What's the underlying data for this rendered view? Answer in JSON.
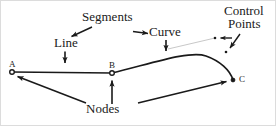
{
  "figure": {
    "kind": "bezier-path-annotation-diagram",
    "background_color": "#ffffff",
    "stroke_color": "#1a1a1a",
    "guide_color": "#c8c8c8",
    "border_color": "#d9d9d9"
  },
  "labels": {
    "segments": "Segments",
    "line": "Line",
    "curve": "Curve",
    "control_line1": "Control",
    "control_line2": "Points",
    "nodes": "Nodes"
  },
  "nodes": [
    {
      "id": "A",
      "label": "A",
      "x": 12,
      "y": 72
    },
    {
      "id": "B",
      "label": "B",
      "x": 112,
      "y": 73
    },
    {
      "id": "C",
      "label": "C",
      "x": 233,
      "y": 80
    }
  ],
  "control_points": [
    {
      "id": "cp1",
      "x": 215,
      "y": 38
    },
    {
      "id": "cp2",
      "x": 226,
      "y": 52
    }
  ],
  "path": {
    "line_segment": "M 12 72 L 112 73",
    "curve_segment": "M 112 73 C 150 64 190 50 206 56 C 220 61 230 70 233 80",
    "tangent_guide": "M 168 49 L 215 38"
  },
  "annotations": [
    {
      "name": "segments-to-line",
      "from": [
        92,
        27
      ],
      "to": [
        70,
        37
      ]
    },
    {
      "name": "segments-to-curve",
      "from": [
        133,
        31
      ],
      "to": [
        150,
        33
      ]
    },
    {
      "name": "line-to-segment",
      "from": [
        65,
        51
      ],
      "to": [
        65,
        64
      ]
    },
    {
      "name": "curve-to-segment",
      "from": [
        166,
        40
      ],
      "to": [
        166,
        52
      ]
    },
    {
      "name": "control-to-cp1",
      "from": [
        232,
        38
      ],
      "to": [
        219,
        38
      ]
    },
    {
      "name": "control-to-cp2",
      "from": [
        240,
        34
      ],
      "to": [
        229,
        49
      ]
    },
    {
      "name": "nodes-to-a",
      "from": [
        88,
        104
      ],
      "to": [
        16,
        76
      ]
    },
    {
      "name": "nodes-to-b",
      "from": [
        112,
        104
      ],
      "to": [
        112,
        80
      ]
    },
    {
      "name": "nodes-to-c",
      "from": [
        136,
        104
      ],
      "to": [
        228,
        81
      ]
    }
  ]
}
